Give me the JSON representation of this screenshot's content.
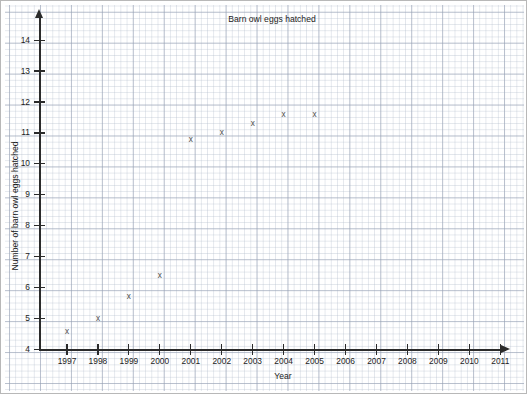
{
  "chart_data": {
    "type": "scatter",
    "title": "Barn owl eggs hatched",
    "xlabel": "Year",
    "ylabel": "Number of barn owl eggs hatched",
    "grid": "graph-paper minor and major gridlines",
    "legend": "none",
    "xlim": [
      1996.4,
      2011.6
    ],
    "ylim": [
      4,
      14.6
    ],
    "x": [
      1997,
      1998,
      1999,
      2000,
      2001,
      2002,
      2003,
      2004,
      2005
    ],
    "values": [
      4.6,
      5.0,
      5.7,
      6.4,
      10.8,
      11.0,
      11.3,
      11.6,
      11.6
    ],
    "marker": "x",
    "marker_color": "#4a4a4a",
    "xticks": [
      1997,
      1998,
      1999,
      2000,
      2001,
      2002,
      2003,
      2004,
      2005,
      2006,
      2007,
      2008,
      2009,
      2010,
      2011
    ],
    "yticks": [
      4,
      5,
      6,
      7,
      8,
      9,
      10,
      11,
      12,
      13,
      14
    ],
    "points": [
      {
        "year": "1997",
        "value": "4.6"
      },
      {
        "year": "1998",
        "value": "5.0"
      },
      {
        "year": "1999",
        "value": "5.7"
      },
      {
        "year": "2000",
        "value": "6.4"
      },
      {
        "year": "2001",
        "value": "10.8"
      },
      {
        "year": "2002",
        "value": "11.0"
      },
      {
        "year": "2003",
        "value": "11.3"
      },
      {
        "year": "2004",
        "value": "11.6"
      },
      {
        "year": "2005",
        "value": "11.6"
      }
    ],
    "marker_glyph": "x"
  },
  "labels": {
    "y": [
      "14",
      "13",
      "12",
      "11",
      "10",
      "9",
      "8",
      "7",
      "6",
      "5",
      "4"
    ],
    "x": [
      "1997",
      "1998",
      "1999",
      "2000",
      "2001",
      "2002",
      "2003",
      "2004",
      "2005",
      "2006",
      "2007",
      "2008",
      "2009",
      "2010",
      "2011"
    ]
  },
  "colors": {
    "axis": "#2b2b2b",
    "marker": "#4a4a4a",
    "grid_major": "#96a0b4",
    "grid_minor": "#b4becd",
    "background": "#ffffff",
    "border": "#b8b8b8"
  }
}
